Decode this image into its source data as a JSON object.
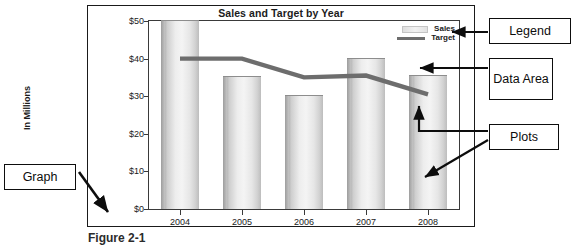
{
  "figure": {
    "caption": "Figure 2-1"
  },
  "chart_data": {
    "type": "bar",
    "title": "Sales and Target by Year",
    "xlabel": "",
    "ylabel": "In Millions",
    "categories": [
      "2004",
      "2005",
      "2006",
      "2007",
      "2008"
    ],
    "ytick_labels": [
      "$0",
      "$10",
      "$20",
      "$30",
      "$40",
      "$50"
    ],
    "ytick_values": [
      0,
      10,
      20,
      30,
      40,
      50
    ],
    "ylim": [
      0,
      50
    ],
    "grid": false,
    "legend_position": "top-right",
    "series": [
      {
        "name": "Sales",
        "type": "bar",
        "values": [
          50,
          35,
          30,
          40,
          35.5
        ],
        "color": "#e6e6e6"
      },
      {
        "name": "Target",
        "type": "line",
        "values": [
          40,
          40,
          35,
          35.5,
          30.5
        ],
        "color": "#6d6d6d"
      }
    ]
  },
  "legend": {
    "entries": [
      {
        "label": "Sales",
        "swatch": "bar-swatch"
      },
      {
        "label": "Target",
        "swatch": "line-swatch"
      }
    ]
  },
  "callouts": {
    "legend": "Legend",
    "data_area": "Data Area",
    "plots": "Plots",
    "graph": "Graph"
  }
}
